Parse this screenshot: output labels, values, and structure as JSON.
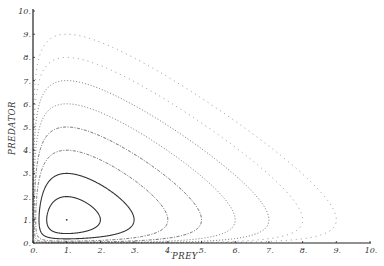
{
  "chart_data": {
    "type": "line",
    "title": "",
    "xlabel": "PREY",
    "ylabel": "PREDATOR",
    "xlim": [
      0,
      10
    ],
    "ylim": [
      0,
      10
    ],
    "xticks": [
      "0.",
      "1.",
      "2.",
      "3.",
      "4.",
      "5.",
      "6.",
      "7.",
      "8.",
      "9.",
      "10."
    ],
    "yticks": [
      "0.",
      "1.",
      "2.",
      "3.",
      "4.",
      "5.",
      "6.",
      "7.",
      "8.",
      "9.",
      "10."
    ],
    "grid": false,
    "legend": "none",
    "equilibrium": {
      "x": 1,
      "y": 1
    },
    "model": "Lotka-Volterra closed orbits, x - ln x + y - ln y = const",
    "series": [
      {
        "name": "orbit-max-2",
        "peak": 2,
        "style": "solid"
      },
      {
        "name": "orbit-max-3",
        "peak": 3,
        "style": "solid"
      },
      {
        "name": "orbit-max-4",
        "peak": 4,
        "style": "dash-dot"
      },
      {
        "name": "orbit-max-5",
        "peak": 5,
        "style": "dash-dot"
      },
      {
        "name": "orbit-max-6",
        "peak": 6,
        "style": "dotted"
      },
      {
        "name": "orbit-max-7",
        "peak": 7,
        "style": "dotted"
      },
      {
        "name": "orbit-max-8",
        "peak": 8,
        "style": "sparse-dotted"
      },
      {
        "name": "orbit-max-9",
        "peak": 9,
        "style": "sparse-dotted"
      }
    ]
  }
}
